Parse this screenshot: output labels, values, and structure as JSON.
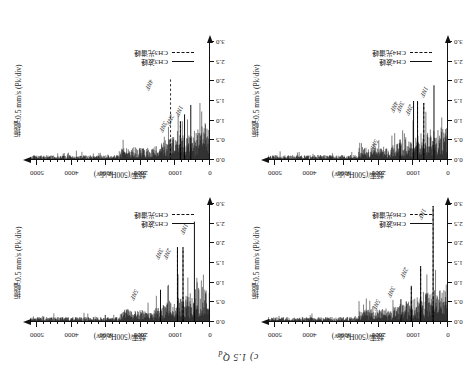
{
  "figure": {
    "caption": "c) 1.5 Q",
    "caption_sub": "d",
    "orientation_note": "rotated-180"
  },
  "axes": {
    "x_title": "频率/(500Hz/div)",
    "y_title": "振幅:0.5 mm/s (Pk/div)",
    "x_ticks": [
      "0",
      "1000",
      "2000",
      "3000",
      "4000",
      "5000"
    ],
    "y_ticks": [
      "0.0",
      "0.5",
      "1.0",
      "1.5",
      "2.0",
      "2.5",
      "3.0"
    ],
    "xlim": [
      0,
      5200
    ],
    "ylim": [
      0,
      3.0
    ]
  },
  "panels": [
    {
      "id": "panel-ch6",
      "channel": "CH6",
      "legend": [
        {
          "label": "CH6波峰",
          "style": "solid"
        },
        {
          "label": "CH6光谱峰",
          "style": "dashed"
        }
      ],
      "annotations": [
        {
          "text": "1NF",
          "x": 0.125,
          "y": 0.96
        },
        {
          "text": "2NF",
          "x": 0.225,
          "y": 0.46
        },
        {
          "text": "3NF",
          "x": 0.3,
          "y": 0.3
        },
        {
          "text": "5NF",
          "x": 0.385,
          "y": 0.19
        }
      ]
    },
    {
      "id": "panel-ch5",
      "channel": "CH5",
      "legend": [
        {
          "label": "CH5波峰",
          "style": "solid"
        },
        {
          "label": "CH5光谱峰",
          "style": "dashed"
        }
      ],
      "annotations": [
        {
          "text": "1NF",
          "x": 0.128,
          "y": 0.83
        },
        {
          "text": "2NF",
          "x": 0.222,
          "y": 0.62
        },
        {
          "text": "3NF",
          "x": 0.268,
          "y": 0.62
        },
        {
          "text": "5NF",
          "x": 0.405,
          "y": 0.27
        }
      ]
    },
    {
      "id": "panel-ch4",
      "channel": "CH4",
      "legend": [
        {
          "label": "CH4波峰",
          "style": "solid"
        },
        {
          "label": "CH4光谱峰",
          "style": "dashed"
        }
      ],
      "annotations": [
        {
          "text": "1NF",
          "x": 0.115,
          "y": 0.62
        },
        {
          "text": "2NF",
          "x": 0.2,
          "y": 0.47
        },
        {
          "text": "3NF",
          "x": 0.25,
          "y": 0.49
        },
        {
          "text": "4NF",
          "x": 0.282,
          "y": 0.49
        },
        {
          "text": "5NF",
          "x": 0.392,
          "y": 0.17
        }
      ]
    },
    {
      "id": "panel-ch3",
      "channel": "CH3",
      "legend": [
        {
          "label": "CH3波峰",
          "style": "solid"
        },
        {
          "label": "CH3光谱峰",
          "style": "dashed"
        }
      ],
      "annotations": [
        {
          "text": "1NF",
          "x": 0.158,
          "y": 0.46
        },
        {
          "text": "2NF",
          "x": 0.208,
          "y": 0.38
        },
        {
          "text": "3NF",
          "x": 0.242,
          "y": 0.32
        },
        {
          "text": "4NF",
          "x": 0.322,
          "y": 0.68
        }
      ]
    }
  ],
  "chart_data": {
    "type": "line",
    "title": "c) 1.5 Qd",
    "xlabel": "频率/(500Hz/div)",
    "ylabel": "振幅:0.5 mm/s (Pk/div)",
    "xlim": [
      0,
      5200
    ],
    "ylim": [
      0,
      3.0
    ],
    "x_ticks": [
      0,
      1000,
      2000,
      3000,
      4000,
      5000
    ],
    "y_ticks": [
      0.0,
      0.5,
      1.0,
      1.5,
      2.0,
      2.5,
      3.0
    ],
    "grid": false,
    "legend_position": "lower-left",
    "note": "Four vibration-velocity amplitude spectra (CH3-CH6); spikes descend from the top axis. Values below are peak amplitude in mm/s (Pk) at the labelled blade-pass harmonics.",
    "series": [
      {
        "name": "CH6波峰",
        "style": "solid",
        "peaks": [
          {
            "label": "1NF",
            "freq": 430,
            "amplitude": 2.95
          },
          {
            "label": "2NF",
            "freq": 790,
            "amplitude": 1.42
          },
          {
            "label": "3NF",
            "freq": 1060,
            "amplitude": 0.92
          },
          {
            "label": "5NF",
            "freq": 1360,
            "amplitude": 0.58
          }
        ]
      },
      {
        "name": "CH6光谱峰",
        "style": "dashed",
        "peaks": [
          {
            "label": "1NF",
            "freq": 430,
            "amplitude": 2.95
          },
          {
            "label": "2NF",
            "freq": 790,
            "amplitude": 1.42
          },
          {
            "label": "3NF",
            "freq": 1060,
            "amplitude": 0.92
          }
        ]
      },
      {
        "name": "CH5波峰",
        "style": "solid",
        "peaks": [
          {
            "label": "1NF",
            "freq": 450,
            "amplitude": 2.55
          },
          {
            "label": "2NF",
            "freq": 780,
            "amplitude": 1.9
          },
          {
            "label": "3NF",
            "freq": 940,
            "amplitude": 1.9
          },
          {
            "label": "5NF",
            "freq": 1430,
            "amplitude": 0.82
          }
        ]
      },
      {
        "name": "CH5光谱峰",
        "style": "dashed",
        "peaks": [
          {
            "label": "2NF",
            "freq": 780,
            "amplitude": 1.9
          },
          {
            "label": "3NF",
            "freq": 940,
            "amplitude": 1.9
          }
        ]
      },
      {
        "name": "CH4波峰",
        "style": "solid",
        "peaks": [
          {
            "label": "1NF",
            "freq": 405,
            "amplitude": 1.9
          },
          {
            "label": "2NF",
            "freq": 700,
            "amplitude": 1.45
          },
          {
            "label": "3NF",
            "freq": 880,
            "amplitude": 1.5
          },
          {
            "label": "4NF",
            "freq": 995,
            "amplitude": 1.5
          },
          {
            "label": "5NF",
            "freq": 1385,
            "amplitude": 0.52
          }
        ]
      },
      {
        "name": "CH4光谱峰",
        "style": "dashed",
        "peaks": [
          {
            "label": "2NF",
            "freq": 700,
            "amplitude": 1.45
          },
          {
            "label": "3NF",
            "freq": 880,
            "amplitude": 1.5
          }
        ]
      },
      {
        "name": "CH3波峰",
        "style": "solid",
        "peaks": [
          {
            "label": "1NF",
            "freq": 555,
            "amplitude": 1.4
          },
          {
            "label": "2NF",
            "freq": 735,
            "amplitude": 1.16
          },
          {
            "label": "3NF",
            "freq": 855,
            "amplitude": 0.98
          }
        ]
      },
      {
        "name": "CH3光谱峰",
        "style": "dashed",
        "peaks": [
          {
            "label": "3NF",
            "freq": 855,
            "amplitude": 0.98
          },
          {
            "label": "4NF",
            "freq": 1140,
            "amplitude": 2.1
          }
        ]
      }
    ]
  }
}
